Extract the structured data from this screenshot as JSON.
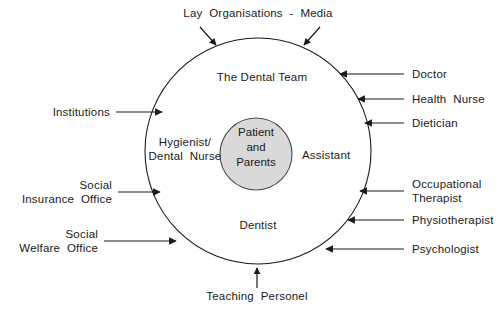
{
  "figure": {
    "background_color": "#ffffff",
    "stroke_color": "#1a1a1a",
    "inner_circle_fill": "#d9d9d9",
    "text_color": "#1a1a1a"
  },
  "circles": {
    "outer": {
      "label": "The Dental Team",
      "center_x": 258,
      "center_y": 151,
      "radius": 113
    },
    "inner": {
      "label_line1": "Patient",
      "label_line2": "and",
      "label_line3": "Parents",
      "center_x": 256,
      "center_y": 154,
      "radius": 36
    }
  },
  "team_roles": {
    "left_line1": "Hygienist/",
    "left_line2": "Dental  Nurse",
    "right": "Assistant",
    "bottom": "Dentist"
  },
  "external_labels": {
    "top": {
      "text": "Lay  Organisations  -  Media",
      "arrow_count": 2
    },
    "bottom": {
      "text": "Teaching  Personel",
      "arrow_count": 1
    },
    "left": [
      {
        "lines": [
          "Institutions"
        ]
      },
      {
        "lines": [
          "Social",
          "Insurance  Office"
        ]
      },
      {
        "lines": [
          "Social",
          "Welfare  Office"
        ]
      }
    ],
    "right": [
      {
        "lines": [
          "Doctor"
        ]
      },
      {
        "lines": [
          "Health  Nurse"
        ]
      },
      {
        "lines": [
          "Dietician"
        ]
      },
      {
        "lines": [
          "Occupational",
          "Therapist"
        ]
      },
      {
        "lines": [
          "Physiotherapist"
        ]
      },
      {
        "lines": [
          "Psychologist"
        ]
      }
    ]
  }
}
